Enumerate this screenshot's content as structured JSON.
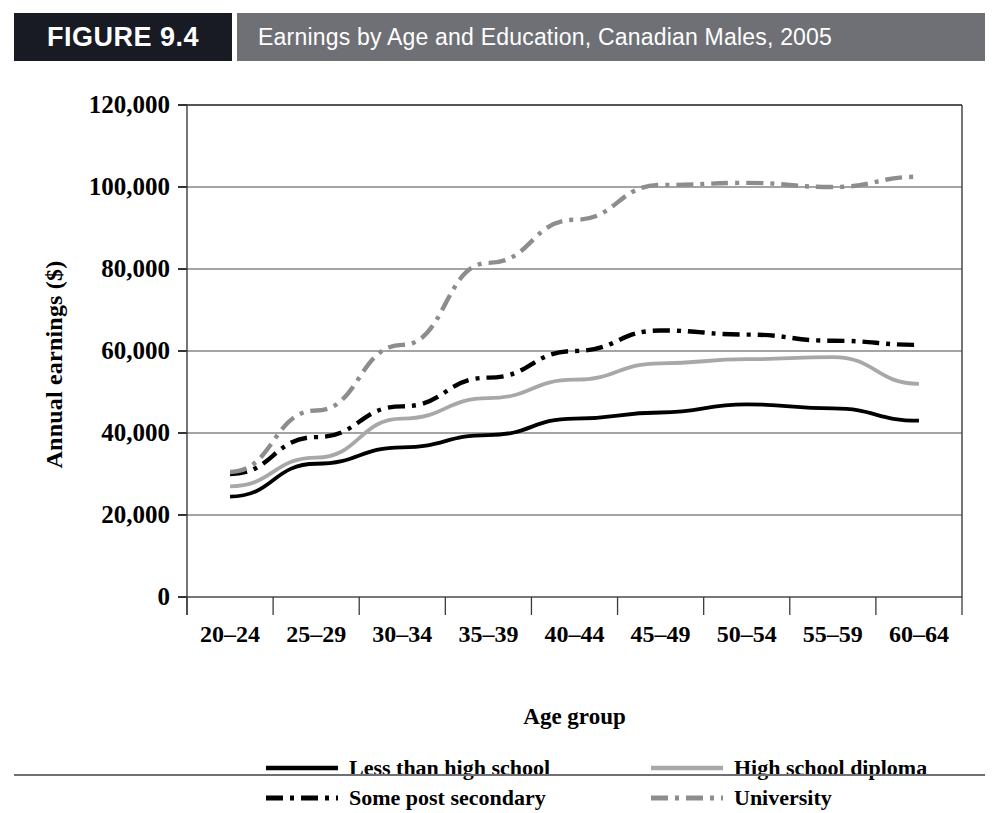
{
  "header": {
    "figure_number": "FIGURE 9.4",
    "title": "Earnings by Age and Education, Canadian Males, 2005",
    "dark_block_color": "#181a24",
    "band_color": "#6f7076"
  },
  "axes": {
    "y_title": "Annual earnings ($)",
    "x_title": "Age group",
    "y_ticks": [
      "0",
      "20,000",
      "40,000",
      "60,000",
      "80,000",
      "100,000",
      "120,000"
    ]
  },
  "legend": {
    "items": [
      {
        "label": "Less than high school",
        "color": "#000000",
        "style": "solid"
      },
      {
        "label": "High school diploma",
        "color": "#a8a8a8",
        "style": "solid"
      },
      {
        "label": "Some post secondary",
        "color": "#000000",
        "style": "dashdot"
      },
      {
        "label": "University",
        "color": "#8d8d8d",
        "style": "dashdot"
      }
    ]
  },
  "chart_data": {
    "type": "line",
    "title": "Earnings by Age and Education, Canadian Males, 2005",
    "xlabel": "Age group",
    "ylabel": "Annual earnings ($)",
    "categories": [
      "20–24",
      "25–29",
      "30–34",
      "35–39",
      "40–44",
      "45–49",
      "50–54",
      "55–59",
      "60–64"
    ],
    "ylim": [
      0,
      120000
    ],
    "ytick_step": 20000,
    "grid": true,
    "legend_position": "below",
    "series": [
      {
        "name": "Less than high school",
        "color": "#000000",
        "style": "solid",
        "values": [
          24500,
          32500,
          36500,
          39500,
          43500,
          45000,
          47000,
          46000,
          43000
        ]
      },
      {
        "name": "High school diploma",
        "color": "#a8a8a8",
        "style": "solid",
        "values": [
          27000,
          34000,
          43500,
          48500,
          53000,
          57000,
          58000,
          58500,
          52000
        ]
      },
      {
        "name": "Some post secondary",
        "color": "#000000",
        "style": "dashdot",
        "values": [
          30000,
          39000,
          46500,
          53500,
          60000,
          65000,
          64000,
          62500,
          61500
        ]
      },
      {
        "name": "University",
        "color": "#8d8d8d",
        "style": "dashdot",
        "values": [
          30500,
          45500,
          61500,
          81500,
          92000,
          100500,
          101000,
          100000,
          102500
        ]
      }
    ]
  }
}
